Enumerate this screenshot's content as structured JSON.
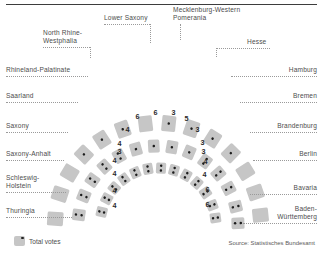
{
  "figure": {
    "legend_label": "Total votes",
    "source": "Source: Statistisches Bundesamt",
    "seat_color": "#c6c6c6",
    "dot_color": "#1c1c1c",
    "label_color": "#4d4d4d",
    "leader_color": "#9a9a9a"
  },
  "labels": {
    "left": [
      {
        "text": "Rhineland-Palatinate",
        "x": 6,
        "y": 66,
        "lead_x": 6,
        "lead_w": 82,
        "lead_y": 76
      },
      {
        "text": "Saarland",
        "x": 6,
        "y": 92,
        "lead_x": 6,
        "lead_w": 72,
        "lead_y": 102
      },
      {
        "text": "Saxony",
        "x": 6,
        "y": 122,
        "lead_x": 6,
        "lead_w": 62,
        "lead_y": 132
      },
      {
        "text": "Saxony-Anhalt",
        "x": 6,
        "y": 150,
        "lead_x": 6,
        "lead_w": 58,
        "lead_y": 160
      },
      {
        "text": "Schleswig-\nHolstein",
        "x": 6,
        "y": 174,
        "lead_x": 6,
        "lead_w": 60,
        "lead_y": 192
      },
      {
        "text": "Thuringia",
        "x": 6,
        "y": 207,
        "lead_x": 6,
        "lead_w": 66,
        "lead_y": 217
      }
    ],
    "right": [
      {
        "text": "Hamburg",
        "x": 317,
        "y": 66,
        "lead_x": 231,
        "lead_w": 86,
        "lead_y": 76
      },
      {
        "text": "Bremen",
        "x": 317,
        "y": 92,
        "lead_x": 240,
        "lead_w": 77,
        "lead_y": 102
      },
      {
        "text": "Brandenburg",
        "x": 317,
        "y": 122,
        "lead_x": 250,
        "lead_w": 67,
        "lead_y": 132
      },
      {
        "text": "Berlin",
        "x": 317,
        "y": 150,
        "lead_x": 253,
        "lead_w": 64,
        "lead_y": 160
      },
      {
        "text": "Bavaria",
        "x": 317,
        "y": 184,
        "lead_x": 250,
        "lead_w": 67,
        "lead_y": 194
      },
      {
        "text": "Baden-\nWürttemberg",
        "x": 317,
        "y": 205,
        "lead_x": 243,
        "lead_w": 74,
        "lead_y": 223
      }
    ],
    "top": [
      {
        "text": "North Rhine-\nWestphalia",
        "x": 43,
        "y": 29,
        "align": "left",
        "lead_x": 43,
        "lead_w": 47,
        "lead_y": 47,
        "stem_x": 90,
        "stem_y1": 47,
        "stem_y2": 58
      },
      {
        "text": "Lower Saxony",
        "x": 104,
        "y": 14,
        "align": "left",
        "lead_x": 104,
        "lead_w": 46,
        "lead_y": 24,
        "stem_x": 150,
        "stem_y1": 24,
        "stem_y2": 43
      },
      {
        "text": "Mecklenburg-Western\nPomerania",
        "x": 173,
        "y": 6,
        "align": "left",
        "lead_x": 173,
        "lead_w": 0,
        "lead_y": 24,
        "stem_x": 180,
        "stem_y1": 24,
        "stem_y2": 40
      },
      {
        "text": "Hesse",
        "x": 247,
        "y": 38,
        "align": "left",
        "lead_x": 216,
        "lead_w": 54,
        "lead_y": 48,
        "stem_x": 216,
        "stem_y1": 48,
        "stem_y2": 57
      }
    ]
  },
  "chart_data": {
    "type": "diagram",
    "title": "",
    "inner_arc_numbers": {
      "top_left_to_right": [
        4,
        6,
        6,
        3,
        5,
        3
      ],
      "left_descending": [
        4,
        3,
        4,
        4,
        4,
        4
      ],
      "right_descending": [
        3,
        3,
        4,
        4,
        6,
        6
      ]
    },
    "number_positions": [
      {
        "value": "4",
        "x": 123,
        "y": 125
      },
      {
        "value": "6",
        "x": 133,
        "y": 112
      },
      {
        "value": "6",
        "x": 151,
        "y": 108
      },
      {
        "value": "3",
        "x": 169,
        "y": 108
      },
      {
        "value": "5",
        "x": 182,
        "y": 114
      },
      {
        "value": "3",
        "x": 193,
        "y": 125
      },
      {
        "value": "4",
        "x": 115,
        "y": 139
      },
      {
        "value": "3",
        "x": 115,
        "y": 147
      },
      {
        "value": "4",
        "x": 110,
        "y": 156
      },
      {
        "value": "4",
        "x": 110,
        "y": 169
      },
      {
        "value": "4",
        "x": 110,
        "y": 186
      },
      {
        "value": "4",
        "x": 110,
        "y": 201
      },
      {
        "value": "3",
        "x": 198,
        "y": 138
      },
      {
        "value": "3",
        "x": 199,
        "y": 147
      },
      {
        "value": "4",
        "x": 201,
        "y": 157
      },
      {
        "value": "4",
        "x": 200,
        "y": 170
      },
      {
        "value": "6",
        "x": 203,
        "y": 185
      },
      {
        "value": "6",
        "x": 203,
        "y": 200
      }
    ],
    "rings": [
      {
        "name": "inner",
        "radius": 58,
        "seat_w": 10,
        "seat_h": 11,
        "angles": [
          -166,
          -152,
          -139,
          -126,
          -113,
          -100,
          -87,
          -74,
          -61,
          -48,
          -35,
          -21,
          -8
        ],
        "dots": [
          2,
          2,
          2,
          2,
          2,
          2,
          2,
          2,
          2,
          2,
          2,
          2,
          2
        ]
      },
      {
        "name": "middle",
        "radius": 80,
        "seat_w": 11.5,
        "seat_h": 13,
        "angles": [
          -172,
          -158,
          -145,
          -132,
          -119,
          -106,
          -93,
          -80,
          -67,
          -54,
          -41,
          -28,
          -14,
          -2
        ],
        "dots": [
          2,
          2,
          2,
          2,
          2,
          1,
          1,
          1,
          1,
          2,
          2,
          2,
          2,
          2
        ]
      },
      {
        "name": "outer",
        "radius": 103,
        "seat_w": 14,
        "seat_h": 16,
        "angles": [
          -176,
          -162,
          -149,
          -136,
          -123,
          -110,
          -97,
          -84,
          -71,
          -58,
          -45,
          -32,
          -19,
          -6
        ],
        "dots": [
          0,
          0,
          0,
          1,
          1,
          1,
          0,
          1,
          1,
          1,
          1,
          0,
          0,
          0
        ]
      }
    ]
  }
}
